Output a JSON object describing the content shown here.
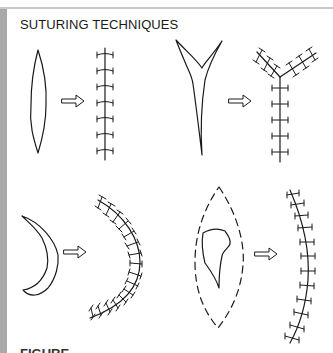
{
  "title": "SUTURING TECHNIQUES",
  "caption": "FIGURE",
  "colors": {
    "ink": "#1a1a1a",
    "frame_left": "#a9a9a9",
    "frame_top": "#c8c8c8",
    "background": "#ffffff"
  },
  "panels": [
    {
      "id": "elliptical",
      "before": "spindle-shaped wound",
      "after": "straight line of interrupted sutures",
      "suture_count": 7
    },
    {
      "id": "y-shaped",
      "before": "Y-shaped laceration",
      "after": "Y-shaped closure with sutures on three limbs",
      "suture_count": 13
    },
    {
      "id": "crescent",
      "before": "crescent-shaped wound",
      "after": "curved line of interrupted sutures",
      "suture_count": 16
    },
    {
      "id": "irregular-excision",
      "before": "irregular wound inside dashed elliptical excision outline",
      "after": "gently curved line of interrupted sutures",
      "suture_count": 12
    }
  ]
}
